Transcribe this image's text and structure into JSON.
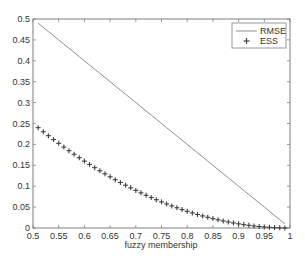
{
  "chart_data": {
    "type": "line",
    "title": "",
    "xlabel": "fuzzy membership",
    "ylabel": "",
    "xlim": [
      0.5,
      1.0
    ],
    "ylim": [
      0,
      0.5
    ],
    "grid": false,
    "legend_position": "top-right",
    "x_ticks": [
      "0.5",
      "0.55",
      "0.6",
      "0.65",
      "0.7",
      "0.75",
      "0.8",
      "0.85",
      "0.9",
      "0.95",
      "1"
    ],
    "y_ticks": [
      "0",
      "0.05",
      "0.1",
      "0.15",
      "0.2",
      "0.25",
      "0.3",
      "0.35",
      "0.4",
      "0.45",
      "0.5"
    ],
    "x": [
      0.51,
      0.52,
      0.53,
      0.54,
      0.55,
      0.56,
      0.57,
      0.58,
      0.59,
      0.6,
      0.61,
      0.62,
      0.63,
      0.64,
      0.65,
      0.66,
      0.67,
      0.68,
      0.69,
      0.7,
      0.71,
      0.72,
      0.73,
      0.74,
      0.75,
      0.76,
      0.77,
      0.78,
      0.79,
      0.8,
      0.81,
      0.82,
      0.83,
      0.84,
      0.85,
      0.86,
      0.87,
      0.88,
      0.89,
      0.9,
      0.91,
      0.92,
      0.93,
      0.94,
      0.95,
      0.96,
      0.97,
      0.98,
      0.99
    ],
    "series": [
      {
        "name": "RMSE",
        "style": "line",
        "color": "#808080",
        "values": [
          0.49,
          0.48,
          0.47,
          0.46,
          0.45,
          0.44,
          0.43,
          0.42,
          0.41,
          0.4,
          0.39,
          0.38,
          0.37,
          0.36,
          0.35,
          0.34,
          0.33,
          0.32,
          0.31,
          0.3,
          0.29,
          0.28,
          0.27,
          0.26,
          0.25,
          0.24,
          0.23,
          0.22,
          0.21,
          0.2,
          0.19,
          0.18,
          0.17,
          0.16,
          0.15,
          0.14,
          0.13,
          0.12,
          0.11,
          0.1,
          0.09,
          0.08,
          0.07,
          0.06,
          0.05,
          0.04,
          0.03,
          0.02,
          0.01
        ]
      },
      {
        "name": "ESS",
        "style": "marker-plus",
        "color": "#404040",
        "values": [
          0.2401,
          0.2304,
          0.2209,
          0.2116,
          0.2025,
          0.1936,
          0.1849,
          0.1764,
          0.1681,
          0.16,
          0.1521,
          0.1444,
          0.1369,
          0.1296,
          0.1225,
          0.1156,
          0.1089,
          0.1024,
          0.0961,
          0.09,
          0.0841,
          0.0784,
          0.0729,
          0.0676,
          0.0625,
          0.0576,
          0.0529,
          0.0484,
          0.0441,
          0.04,
          0.0361,
          0.0324,
          0.0289,
          0.0256,
          0.0225,
          0.0196,
          0.0169,
          0.0144,
          0.0121,
          0.01,
          0.0081,
          0.0064,
          0.0049,
          0.0036,
          0.0025,
          0.0016,
          0.0009,
          0.0004,
          0.0001
        ]
      }
    ]
  },
  "legend": {
    "items": [
      {
        "label": "RMSE",
        "symbol": "line"
      },
      {
        "label": "ESS",
        "symbol": "plus"
      }
    ]
  },
  "axes": {
    "xlabel": "fuzzy membership"
  }
}
